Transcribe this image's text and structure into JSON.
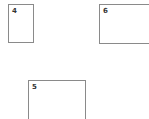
{
  "boxes": [
    {
      "label": "4"
    },
    {
      "label": "6"
    },
    {
      "label": "5"
    }
  ],
  "colors": {
    "border": "#8a8a8a",
    "background": "#ffffff",
    "label": "#333333"
  }
}
